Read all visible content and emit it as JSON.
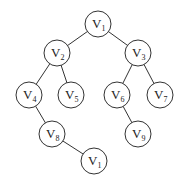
{
  "diagram": {
    "type": "binary-tree",
    "nodes": [
      {
        "id": "n1",
        "label": "V",
        "sub": "1",
        "x": 98,
        "y": 24
      },
      {
        "id": "n2",
        "label": "V",
        "sub": "2",
        "x": 57,
        "y": 53
      },
      {
        "id": "n3",
        "label": "V",
        "sub": "3",
        "x": 138,
        "y": 53
      },
      {
        "id": "n4",
        "label": "V",
        "sub": "4",
        "x": 29,
        "y": 95
      },
      {
        "id": "n5",
        "label": "V",
        "sub": "5",
        "x": 71,
        "y": 95
      },
      {
        "id": "n6",
        "label": "V",
        "sub": "6",
        "x": 117,
        "y": 95
      },
      {
        "id": "n7",
        "label": "V",
        "sub": "7",
        "x": 160,
        "y": 95
      },
      {
        "id": "n8",
        "label": "V",
        "sub": "8",
        "x": 52,
        "y": 134
      },
      {
        "id": "n9",
        "label": "V",
        "sub": "9",
        "x": 138,
        "y": 134
      },
      {
        "id": "n10",
        "label": "V",
        "sub": "1",
        "x": 94,
        "y": 161
      }
    ],
    "edges": [
      [
        "n1",
        "n2"
      ],
      [
        "n1",
        "n3"
      ],
      [
        "n2",
        "n4"
      ],
      [
        "n2",
        "n5"
      ],
      [
        "n3",
        "n6"
      ],
      [
        "n3",
        "n7"
      ],
      [
        "n4",
        "n8"
      ],
      [
        "n8",
        "n10"
      ],
      [
        "n6",
        "n9"
      ]
    ]
  }
}
